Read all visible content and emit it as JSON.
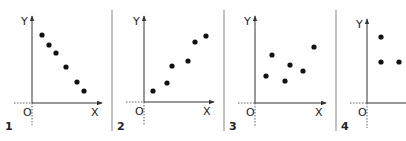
{
  "chart_data": [
    {
      "type": "scatter",
      "panel_label": "1",
      "xlabel": "X",
      "ylabel": "Y",
      "origin_label": "O",
      "description": "negative linear correlation",
      "points_px": [
        [
          42,
          35
        ],
        [
          49,
          45
        ],
        [
          56,
          53
        ],
        [
          66,
          67
        ],
        [
          77,
          82
        ],
        [
          84,
          91
        ]
      ],
      "axes_px": {
        "origin": [
          32,
          103
        ],
        "x_end": 102,
        "y_top": 16,
        "x_start_dotted": 14,
        "y_bottom_dotted": 125
      },
      "grid": false
    },
    {
      "type": "scatter",
      "panel_label": "2",
      "xlabel": "X",
      "ylabel": "Y",
      "origin_label": "O",
      "description": "positive linear correlation",
      "points_px": [
        [
          153,
          91
        ],
        [
          167,
          83
        ],
        [
          172,
          66
        ],
        [
          188,
          61
        ],
        [
          195,
          42
        ],
        [
          206,
          36
        ]
      ],
      "axes_px": {
        "origin": [
          144,
          102
        ],
        "x_end": 214,
        "y_top": 16,
        "x_start_dotted": 126,
        "y_bottom_dotted": 125
      },
      "grid": false
    },
    {
      "type": "scatter",
      "panel_label": "3",
      "xlabel": "X",
      "ylabel": "Y",
      "origin_label": "O",
      "description": "no correlation",
      "points_px": [
        [
          266,
          76
        ],
        [
          272,
          55
        ],
        [
          285,
          81
        ],
        [
          290,
          65
        ],
        [
          303,
          71
        ],
        [
          314,
          47
        ]
      ],
      "axes_px": {
        "origin": [
          255,
          103
        ],
        "x_end": 326,
        "y_top": 16,
        "x_start_dotted": 238,
        "y_bottom_dotted": 126
      },
      "grid": false
    },
    {
      "type": "scatter",
      "panel_label": "4",
      "xlabel": "",
      "ylabel": "Y",
      "origin_label": "O",
      "description": "few points, partial view",
      "points_px": [
        [
          381,
          37
        ],
        [
          381,
          62
        ],
        [
          399,
          62
        ]
      ],
      "axes_px": {
        "origin": [
          367,
          103
        ],
        "x_end": 406,
        "y_top": 19,
        "x_start_dotted": 350,
        "y_bottom_dotted": 128
      },
      "grid": false
    }
  ],
  "separators_px": [
    112,
    224,
    336
  ],
  "style": {
    "axis_color": "#333333",
    "point_color": "#111111",
    "separator_color": "#aaaaaa",
    "text_color": "#222222"
  }
}
